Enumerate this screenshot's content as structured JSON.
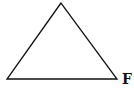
{
  "diagram": {
    "type": "triangle",
    "stroke_color": "#111111",
    "background": "#ffffff",
    "vertices": {
      "top": [
        61,
        3
      ],
      "bottom_left": [
        7,
        79
      ],
      "bottom_right": [
        117,
        79
      ]
    },
    "labels": {
      "bottom_left": "",
      "bottom_right": "F"
    }
  }
}
